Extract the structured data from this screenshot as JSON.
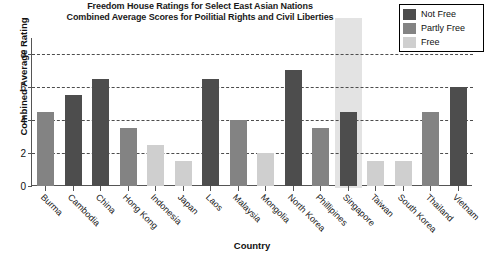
{
  "chart_data": {
    "type": "bar",
    "title": "Freedom House Ratings for Select East Asian Nations Combined Average Scores for Poilitial Rights and Civil Liberties",
    "title_line1": "Freedom House Ratings for Select East Asian Nations",
    "title_line2": "Combined Average Scores for Poilitial Rights and Civil Liberties",
    "xlabel": "Country",
    "ylabel": "Combined Average Rating",
    "ylim": [
      0,
      8.6
    ],
    "yticks": [
      0,
      2,
      4,
      6,
      8
    ],
    "ytick_labels": [
      "0",
      "2",
      "4",
      "6",
      "8"
    ],
    "grid": "horizontal-dashed",
    "legend_position": "top-right",
    "categories": [
      "Burma",
      "Cambodia",
      "China",
      "Hong Kong",
      "Indonesia",
      "Japan",
      "Laos",
      "Malaysia",
      "Mongolia",
      "North Korea",
      "Phillipines",
      "Singapore",
      "Taiwan",
      "South Korea",
      "Thailand",
      "Vietnam"
    ],
    "values": [
      4.5,
      5.5,
      6.5,
      3.5,
      2.5,
      1.5,
      6.5,
      4.0,
      2.0,
      7.0,
      3.5,
      4.5,
      1.5,
      1.5,
      4.5,
      6.0
    ],
    "point_categories": [
      "Partly Free",
      "Not Free",
      "Not Free",
      "Partly Free",
      "Free",
      "Free",
      "Not Free",
      "Partly Free",
      "Free",
      "Not Free",
      "Partly Free",
      "Not Free",
      "Free",
      "Free",
      "Partly Free",
      "Not Free"
    ],
    "highlighted_category": "Singapore",
    "series": [
      {
        "name": "Combined Average Rating",
        "values": [
          4.5,
          5.5,
          6.5,
          3.5,
          2.5,
          1.5,
          6.5,
          4.0,
          2.0,
          7.0,
          3.5,
          4.5,
          1.5,
          1.5,
          4.5,
          6.0
        ]
      }
    ]
  },
  "legend": {
    "items": [
      {
        "label": "Not Free",
        "color": "#4d4d4d"
      },
      {
        "label": "Partly Free",
        "color": "#838383"
      },
      {
        "label": "Free",
        "color": "#cfcfcf"
      }
    ]
  },
  "colors": {
    "not_free": "#4d4d4d",
    "partly_free": "#838383",
    "free": "#cfcfcf",
    "highlight_band": "#e3e3e3",
    "axis": "#555555",
    "gridline": "#4d4d4d",
    "text": "#111111",
    "background": "#ffffff"
  },
  "footer": {
    "clipped_text": ""
  }
}
